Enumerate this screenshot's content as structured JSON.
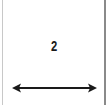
{
  "diagram": {
    "value_label": "2",
    "arrow": {
      "type": "double-headed-horizontal",
      "color": "#1a1a1a"
    },
    "colors": {
      "background": "#ffffff",
      "left_border": "#c8c8c8",
      "right_border": "#8a8a8a",
      "text": "#1a1a1a"
    }
  }
}
